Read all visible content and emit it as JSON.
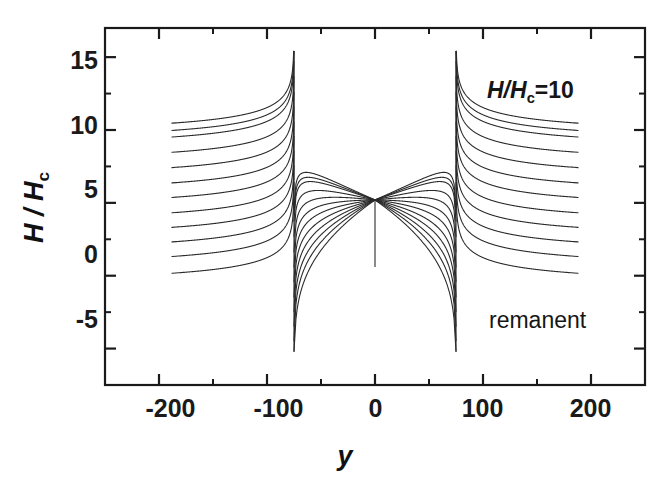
{
  "chart_data": {
    "type": "line",
    "title": "",
    "xlabel": "y",
    "ylabel": "H / H_c",
    "ylabel_main": "H / H",
    "ylabel_sub": "c",
    "xlim": [
      -250,
      250
    ],
    "ylim": [
      -7.5,
      17.0
    ],
    "grid": false,
    "legend": "none",
    "x_ticks_major": [
      -200,
      -100,
      0,
      100,
      200
    ],
    "x_ticks_major_labels": [
      "-200",
      "-100",
      "0",
      "100",
      "200"
    ],
    "x_ticks_minor": [
      -250,
      -150,
      -50,
      50,
      150,
      250
    ],
    "y_ticks_major": [
      -5,
      0,
      5,
      10,
      15
    ],
    "y_ticks_major_labels": [
      "-5",
      "0",
      "5",
      "10",
      "15"
    ],
    "y_ticks_minor": [
      -7.5,
      -2.5,
      2.5,
      7.5,
      12.5
    ],
    "tick_direction": "in",
    "line_color": "#2a2a2a",
    "line_width": 1.1,
    "background": "#ffffff",
    "frame_color": "#1a1a1a",
    "singularity_x": [
      -75,
      75
    ],
    "singularity_top_y": 15.4,
    "singularity_bottom_y": -5.2,
    "center_x": 0,
    "center_y": 5.2,
    "center_tail_bottom_y": 0.6,
    "x_data_start": -188,
    "x_data_end": 188,
    "series": [
      {
        "name": "level-0",
        "asymptote": -0.1,
        "inner_peak": 5.2
      },
      {
        "name": "level-1",
        "asymptote": 1.05,
        "inner_peak": 5.2
      },
      {
        "name": "level-2",
        "asymptote": 2.05,
        "inner_peak": 5.2
      },
      {
        "name": "level-3",
        "asymptote": 3.05,
        "inner_peak": 5.2
      },
      {
        "name": "level-4",
        "asymptote": 4.05,
        "inner_peak": 5.2
      },
      {
        "name": "level-5",
        "asymptote": 5.1,
        "inner_peak": 5.2
      },
      {
        "name": "level-6",
        "asymptote": 6.1,
        "inner_peak": 5.2
      },
      {
        "name": "level-7",
        "asymptote": 7.15,
        "inner_peak": 5.2
      },
      {
        "name": "level-8",
        "asymptote": 8.2,
        "inner_peak": 5.2
      },
      {
        "name": "level-9",
        "asymptote": 9.25,
        "inner_peak": 5.2
      },
      {
        "name": "level-10",
        "asymptote": 9.7,
        "inner_peak": 5.2
      },
      {
        "name": "level-11",
        "asymptote": 10.2,
        "inner_peak": 5.2
      }
    ]
  },
  "annotations": {
    "field_label_main": "H/H",
    "field_label_sub": "c",
    "field_label_value": "=10",
    "field_label_full": "H/H_c=10",
    "state_label": "remanent"
  }
}
